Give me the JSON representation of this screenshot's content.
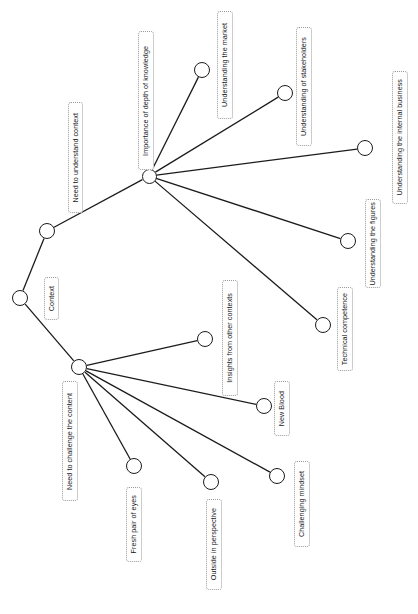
{
  "diagram": {
    "type": "node-link-tree",
    "orientation": "rotated-90-labels-vertical",
    "canvas": {
      "width": 418,
      "height": 614,
      "background": "#ffffff"
    },
    "style": {
      "node_stroke": "#1b1b1b",
      "node_fill": "#ffffff",
      "edge_stroke": "#1b1b1b",
      "label_border": "#9a9a9a",
      "label_fill": "#ffffff",
      "label_text_color": "#16181a"
    },
    "nodes": [
      {
        "id": "context",
        "label": "Context",
        "cx": 20,
        "cy": 298,
        "r": 8,
        "label_box": {
          "x": 44,
          "y": 277,
          "w": 15,
          "h": 43
        }
      },
      {
        "id": "need-to-understand-context",
        "label": "Need to understand context",
        "cx": 47,
        "cy": 231,
        "r": 8,
        "label_box": {
          "x": 68,
          "y": 102,
          "w": 15,
          "h": 111
        }
      },
      {
        "id": "importance-of-depth-of-knowledge",
        "label": "Importance of depth of knowledge",
        "cx": 149,
        "cy": 176,
        "r": 7.5,
        "label_box": {
          "x": 138,
          "y": 31,
          "w": 16,
          "h": 139
        }
      },
      {
        "id": "understanding-the-market",
        "label": "Understanding the market",
        "cx": 202,
        "cy": 70,
        "r": 8,
        "label_box": {
          "x": 217,
          "y": 11,
          "w": 16,
          "h": 108
        }
      },
      {
        "id": "understanding-of-stakeholders",
        "label": "Understanding of stakeholders",
        "cx": 285,
        "cy": 93,
        "r": 8,
        "label_box": {
          "x": 296,
          "y": 27,
          "w": 16,
          "h": 119
        }
      },
      {
        "id": "understanding-the-internal-business",
        "label": "Understanding the internal business",
        "cx": 365,
        "cy": 148,
        "r": 8,
        "label_box": {
          "x": 392,
          "y": 71,
          "w": 16,
          "h": 133
        }
      },
      {
        "id": "understanding-the-figures",
        "label": "Understanding the figures",
        "cx": 348,
        "cy": 241,
        "r": 8,
        "label_box": {
          "x": 365,
          "y": 199,
          "w": 16,
          "h": 89
        }
      },
      {
        "id": "technical-competence",
        "label": "Technical competence",
        "cx": 323,
        "cy": 325,
        "r": 8,
        "label_box": {
          "x": 337,
          "y": 287,
          "w": 16,
          "h": 84
        }
      },
      {
        "id": "need-to-challenge-the-content",
        "label": "Need to challenge the content",
        "cx": 79,
        "cy": 367,
        "r": 8,
        "label_box": {
          "x": 62,
          "y": 381,
          "w": 16,
          "h": 120
        }
      },
      {
        "id": "insights-from-other-contexts",
        "label": "Insights from other contexts",
        "cx": 205,
        "cy": 339,
        "r": 8,
        "label_box": {
          "x": 222,
          "y": 280,
          "w": 16,
          "h": 116
        }
      },
      {
        "id": "new-blood",
        "label": "New Blood",
        "cx": 264,
        "cy": 406,
        "r": 8,
        "label_box": {
          "x": 274,
          "y": 381,
          "w": 16,
          "h": 55
        }
      },
      {
        "id": "challenging-mindset",
        "label": "Challenging mindset",
        "cx": 277,
        "cy": 476,
        "r": 8,
        "label_box": {
          "x": 294,
          "y": 461,
          "w": 16,
          "h": 86
        }
      },
      {
        "id": "outside-in-perspective",
        "label": "Outside in perspective",
        "cx": 211,
        "cy": 482,
        "r": 8,
        "label_box": {
          "x": 206,
          "y": 499,
          "w": 16,
          "h": 91
        }
      },
      {
        "id": "fresh-pair-of-eyes",
        "label": "Fresh pair of eyes",
        "cx": 134,
        "cy": 466,
        "r": 8,
        "label_box": {
          "x": 126,
          "y": 487,
          "w": 16,
          "h": 75
        }
      }
    ],
    "edges": [
      {
        "from": "context",
        "to": "need-to-understand-context"
      },
      {
        "from": "context",
        "to": "need-to-challenge-the-content"
      },
      {
        "from": "need-to-understand-context",
        "to": "importance-of-depth-of-knowledge"
      },
      {
        "from": "importance-of-depth-of-knowledge",
        "to": "understanding-the-market"
      },
      {
        "from": "importance-of-depth-of-knowledge",
        "to": "understanding-of-stakeholders"
      },
      {
        "from": "importance-of-depth-of-knowledge",
        "to": "understanding-the-internal-business"
      },
      {
        "from": "importance-of-depth-of-knowledge",
        "to": "understanding-the-figures"
      },
      {
        "from": "importance-of-depth-of-knowledge",
        "to": "technical-competence"
      },
      {
        "from": "need-to-challenge-the-content",
        "to": "insights-from-other-contexts"
      },
      {
        "from": "need-to-challenge-the-content",
        "to": "new-blood"
      },
      {
        "from": "need-to-challenge-the-content",
        "to": "challenging-mindset"
      },
      {
        "from": "need-to-challenge-the-content",
        "to": "outside-in-perspective"
      },
      {
        "from": "need-to-challenge-the-content",
        "to": "fresh-pair-of-eyes"
      }
    ]
  }
}
